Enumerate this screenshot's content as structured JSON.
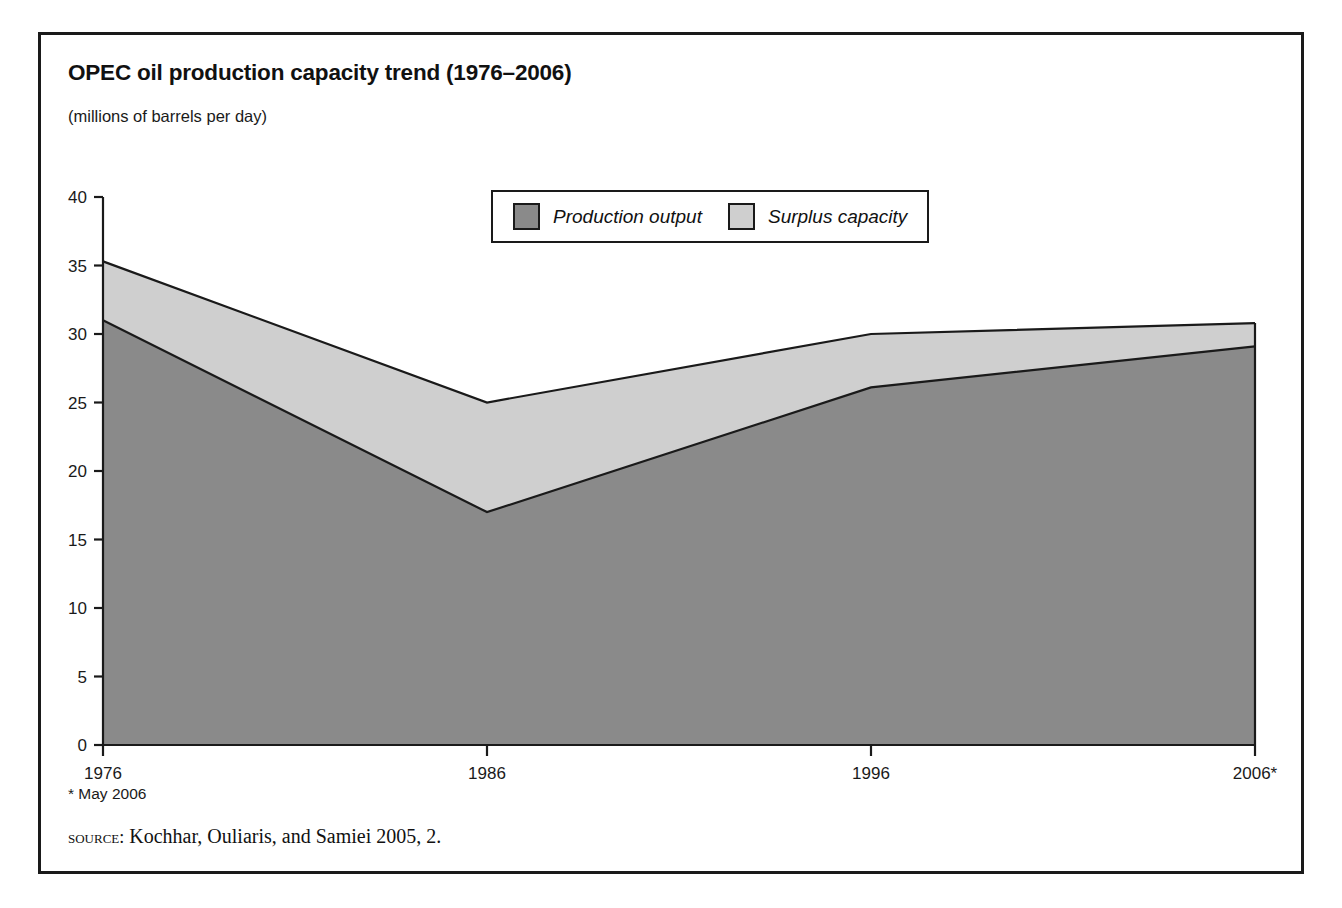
{
  "figure": {
    "title": "OPEC oil production capacity trend (1976–2006)",
    "subtitle": "(millions of barrels per day)",
    "footnote": "* May 2006",
    "source_keyword": "source:",
    "source_text": " Kochhar, Ouliaris, and Samiei 2005, 2."
  },
  "legend": {
    "entries": [
      {
        "label": "Production output",
        "color": "#8a8a8a"
      },
      {
        "label": "Surplus capacity",
        "color": "#cfcfcf"
      }
    ]
  },
  "colors": {
    "production_fill": "#8a8a8a",
    "surplus_fill": "#cfcfcf",
    "outline": "#1a1a1a",
    "frame": "#1a1a1a",
    "background": "#ffffff"
  },
  "chart_data": {
    "type": "area",
    "stacked": true,
    "title": "OPEC oil production capacity trend (1976–2006)",
    "subtitle": "(millions of barrels per day)",
    "xlabel": "",
    "ylabel": "",
    "ylim": [
      0,
      40
    ],
    "yticks": [
      0,
      5,
      10,
      15,
      20,
      25,
      30,
      35,
      40
    ],
    "ytick_labels": [
      "0",
      "5",
      "10",
      "15",
      "20",
      "25",
      "30",
      "35",
      "40"
    ],
    "x": [
      1976,
      1986,
      1996,
      2006
    ],
    "xtick_labels": [
      "1976",
      "1986",
      "1996",
      "2006*"
    ],
    "grid": false,
    "legend_position": "top-center",
    "series": [
      {
        "name": "Production output",
        "values": [
          31.0,
          17.0,
          26.1,
          29.1
        ]
      },
      {
        "name": "Surplus capacity",
        "values": [
          4.3,
          8.0,
          3.9,
          1.7
        ]
      }
    ],
    "total_capacity": [
      35.3,
      25.0,
      30.0,
      30.8
    ],
    "annotations": [
      "* May 2006"
    ]
  }
}
